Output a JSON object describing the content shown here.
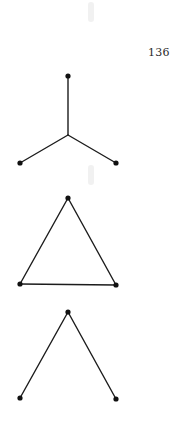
{
  "page": {
    "page_number": "136"
  },
  "figures": [
    {
      "name": "star-graph",
      "description": "Claw / star graph: one center vertex joined to three leaves",
      "nodes": [
        [
          68,
          76
        ],
        [
          20,
          163
        ],
        [
          116,
          163
        ]
      ],
      "center": [
        68,
        135
      ],
      "edges": [
        [
          [
            68,
            76
          ],
          [
            68,
            135
          ]
        ],
        [
          [
            68,
            135
          ],
          [
            20,
            163
          ]
        ],
        [
          [
            68,
            135
          ],
          [
            116,
            163
          ]
        ]
      ]
    },
    {
      "name": "triangle-graph",
      "description": "Complete graph on three vertices (triangle)",
      "nodes": [
        [
          68,
          198
        ],
        [
          20,
          284
        ],
        [
          116,
          285
        ]
      ],
      "edges": [
        [
          [
            68,
            198
          ],
          [
            20,
            284
          ]
        ],
        [
          [
            68,
            198
          ],
          [
            116,
            285
          ]
        ],
        [
          [
            20,
            284
          ],
          [
            116,
            285
          ]
        ]
      ]
    },
    {
      "name": "path-graph",
      "description": "Path on three vertices drawn as an inverted V",
      "nodes": [
        [
          68,
          312
        ],
        [
          20,
          398
        ],
        [
          116,
          399
        ]
      ],
      "edges": [
        [
          [
            68,
            312
          ],
          [
            20,
            398
          ]
        ],
        [
          [
            68,
            312
          ],
          [
            116,
            399
          ]
        ]
      ]
    }
  ],
  "colors": {
    "ink": "#1c1c1c",
    "background": "#ffffff"
  }
}
